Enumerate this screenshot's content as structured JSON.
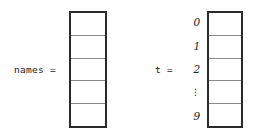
{
  "figure": {
    "type": "array-diagram",
    "background_color": "#fefefe",
    "box_border_color": "#2b2b2b",
    "cell_divider_color": "#8a8a8a",
    "text_color": "#1a1a1a"
  },
  "arrays": [
    {
      "id": "names",
      "label": "names =",
      "cell_count": 5,
      "cells": [
        "",
        "",
        "",
        "",
        ""
      ],
      "indices": [],
      "has_index_column": false
    },
    {
      "id": "t",
      "label": "t =",
      "cell_count": 5,
      "cells": [
        "",
        "",
        "",
        "",
        ""
      ],
      "indices": [
        "0",
        "1",
        "2",
        "⋮",
        "9"
      ],
      "has_index_column": true
    }
  ]
}
